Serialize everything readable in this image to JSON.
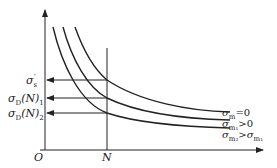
{
  "diagram": {
    "title": "",
    "axes": {
      "origin_label": "O",
      "x_marker_label": "N"
    },
    "y_labels": [
      {
        "sym": "σ",
        "sub": "s",
        "sup": "′",
        "suffix": ""
      },
      {
        "sym": "σ",
        "sub": "D",
        "suffix": "(N)",
        "tail_sub": "1"
      },
      {
        "sym": "σ",
        "sub": "D",
        "suffix": "(N)",
        "tail_sub": "2"
      }
    ],
    "curves": [
      {
        "sym": "σ",
        "sub": "m",
        "relation": "=0"
      },
      {
        "sym": "σ",
        "sub": "m₁",
        "relation": ">0"
      },
      {
        "sym": "σ",
        "sub": "m₂",
        "relation": ">",
        "rhs_sym": "σ",
        "rhs_sub": "m₁"
      }
    ],
    "colors": {
      "line": "#222222",
      "background": "#ffffff"
    }
  }
}
